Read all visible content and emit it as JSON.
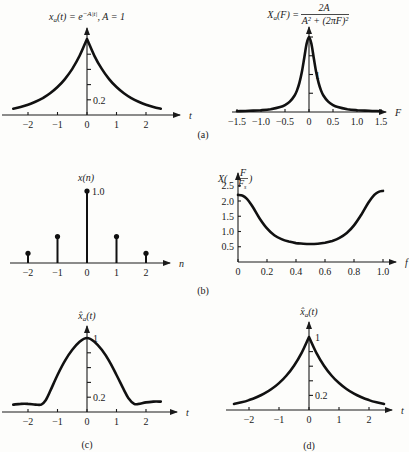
{
  "captions": {
    "a": "(a)",
    "b": "(b)",
    "c": "(c)",
    "d": "(d)"
  },
  "chart_data": [
    {
      "id": "a-left",
      "type": "line",
      "title": "x_a(t) = e^{-A|t|}, A = 1",
      "title_parts": {
        "lhs": "x",
        "sub": "a",
        "mid": "(t) = e",
        "sup": "−A|t|",
        "rhs": ", A = 1"
      },
      "xlabel": "t",
      "ylabel": "",
      "xlim": [
        -2.6,
        2.8
      ],
      "ylim": [
        0,
        1.1
      ],
      "xticks": [
        -2,
        -1,
        0,
        1,
        2
      ],
      "xtick_labels": [
        "−2",
        "−1",
        "0",
        "1",
        "2"
      ],
      "yticks": [
        0.2,
        0.4,
        0.6,
        0.8
      ],
      "ytick_labels_shown": {
        "0.2": "0.2"
      },
      "x": [
        -2.5,
        -2.25,
        -2,
        -1.75,
        -1.5,
        -1.25,
        -1,
        -0.75,
        -0.5,
        -0.25,
        0,
        0.25,
        0.5,
        0.75,
        1,
        1.25,
        1.5,
        1.75,
        2,
        2.25,
        2.5
      ],
      "y": [
        0.082,
        0.105,
        0.135,
        0.174,
        0.223,
        0.287,
        0.368,
        0.472,
        0.607,
        0.779,
        1.0,
        0.779,
        0.607,
        0.472,
        0.368,
        0.287,
        0.223,
        0.174,
        0.135,
        0.105,
        0.082
      ]
    },
    {
      "id": "a-right",
      "type": "line",
      "title": "X_a(F) = 2A / (A^2 + (2πF)^2)",
      "title_parts": {
        "lhs": "X",
        "sub": "a",
        "mid": "(F) = ",
        "num": "2A",
        "den": "A² + (2πF)²"
      },
      "xlabel": "F",
      "ylabel": "",
      "xlim": [
        -1.55,
        1.65
      ],
      "ylim": [
        0,
        2.2
      ],
      "xticks": [
        -1.5,
        -1.0,
        -0.5,
        0,
        0.5,
        1.0,
        1.5
      ],
      "xtick_labels": [
        "−1.5",
        "−1.0",
        "−0.5",
        "0",
        "0.5",
        "1.0",
        "1.5"
      ],
      "yticks": [
        0.5,
        1,
        1.5,
        2
      ],
      "ytick_labels_shown": {
        "1": "1"
      },
      "x": [
        -1.5,
        -1.25,
        -1.0,
        -0.8,
        -0.6,
        -0.5,
        -0.4,
        -0.3,
        -0.25,
        -0.2,
        -0.15,
        -0.1,
        -0.05,
        0,
        0.05,
        0.1,
        0.15,
        0.2,
        0.25,
        0.3,
        0.4,
        0.5,
        0.6,
        0.8,
        1.0,
        1.25,
        1.5
      ],
      "y": [
        0.022,
        0.032,
        0.049,
        0.076,
        0.132,
        0.184,
        0.274,
        0.439,
        0.577,
        0.775,
        1.058,
        1.434,
        1.82,
        2.0,
        1.82,
        1.434,
        1.058,
        0.775,
        0.577,
        0.439,
        0.274,
        0.184,
        0.132,
        0.076,
        0.049,
        0.032,
        0.022
      ]
    },
    {
      "id": "b-left",
      "type": "stem",
      "title": "x(n)",
      "xlabel": "n",
      "xlim": [
        -2.6,
        2.8
      ],
      "ylim": [
        0,
        1.1
      ],
      "xticks": [
        -2,
        -1,
        0,
        1,
        2
      ],
      "xtick_labels": [
        "−2",
        "−1",
        "0",
        "1",
        "2"
      ],
      "annotation": "1.0",
      "x": [
        -2,
        -1,
        0,
        1,
        2
      ],
      "y": [
        0.135,
        0.368,
        1.0,
        0.368,
        0.135
      ]
    },
    {
      "id": "b-right",
      "type": "line",
      "title": "X(F/F_s)",
      "title_parts": {
        "lhs": "X(",
        "num": "F",
        "den": "F",
        "densub": "s",
        "rhs": ")"
      },
      "xlabel": "f",
      "xlim": [
        0,
        1.1
      ],
      "ylim": [
        0,
        2.7
      ],
      "xticks": [
        0,
        0.2,
        0.4,
        0.6,
        0.8,
        1.0
      ],
      "xtick_labels": [
        "0",
        "0.2",
        "0.4",
        "0.6",
        "0.8",
        "1.0"
      ],
      "yticks": [
        0.5,
        1.0,
        1.5,
        2.0,
        2.5
      ],
      "ytick_labels": [
        "0.5",
        "1.0",
        "1.5",
        "2.0",
        "2.5"
      ],
      "x": [
        0,
        0.03,
        0.06,
        0.1,
        0.15,
        0.2,
        0.25,
        0.3,
        0.35,
        0.4,
        0.45,
        0.5,
        0.55,
        0.6,
        0.65,
        0.7,
        0.75,
        0.8,
        0.85,
        0.9,
        0.94,
        0.97,
        1.0
      ],
      "y": [
        2.2,
        2.18,
        2.08,
        1.82,
        1.42,
        1.1,
        0.88,
        0.75,
        0.67,
        0.62,
        0.6,
        0.59,
        0.6,
        0.63,
        0.69,
        0.79,
        0.95,
        1.2,
        1.55,
        1.95,
        2.2,
        2.3,
        2.33
      ]
    },
    {
      "id": "c",
      "type": "line",
      "title": "x̂_a(t)",
      "title_parts": {
        "lhs": "x̂",
        "sub": "a",
        "rhs": "(t)"
      },
      "xlabel": "t",
      "xlim": [
        -2.6,
        2.8
      ],
      "ylim": [
        0,
        1.1
      ],
      "xticks": [
        -2,
        -1,
        0,
        1,
        2
      ],
      "xtick_labels": [
        "−2",
        "−1",
        "0",
        "1",
        "2"
      ],
      "yticks": [
        0.2,
        0.4,
        0.6,
        0.8
      ],
      "ytick_labels_shown": {
        "0.2": "0.2",
        "1": "1"
      },
      "x": [
        -2.5,
        -2.25,
        -2,
        -1.75,
        -1.55,
        -1.4,
        -1.25,
        -1,
        -0.75,
        -0.5,
        -0.25,
        0,
        0.25,
        0.5,
        0.75,
        1,
        1.25,
        1.4,
        1.6,
        1.75,
        2,
        2.25,
        2.5
      ],
      "y": [
        0.1,
        0.11,
        0.11,
        0.1,
        0.1,
        0.16,
        0.28,
        0.5,
        0.69,
        0.84,
        0.95,
        1.0,
        0.95,
        0.84,
        0.69,
        0.5,
        0.3,
        0.19,
        0.11,
        0.11,
        0.13,
        0.14,
        0.14
      ]
    },
    {
      "id": "d",
      "type": "line",
      "title": "x̂_a(t)",
      "title_parts": {
        "lhs": "x̂",
        "sub": "a",
        "rhs": "(t)"
      },
      "xlabel": "t",
      "xlim": [
        -2.6,
        2.8
      ],
      "ylim": [
        0,
        1.1
      ],
      "xticks": [
        -2,
        -1,
        0,
        1,
        2
      ],
      "xtick_labels": [
        "−2",
        "−1",
        "0",
        "1",
        "2"
      ],
      "yticks": [
        0.2,
        0.4,
        0.6,
        0.8
      ],
      "ytick_labels_shown": {
        "0.2": "0.2",
        "1": "1"
      },
      "x": [
        -2.5,
        -2.25,
        -2,
        -1.75,
        -1.5,
        -1.25,
        -1,
        -0.75,
        -0.5,
        -0.25,
        0,
        0.25,
        0.5,
        0.75,
        1,
        1.25,
        1.5,
        1.75,
        2,
        2.25,
        2.5
      ],
      "y": [
        0.082,
        0.105,
        0.135,
        0.174,
        0.223,
        0.287,
        0.368,
        0.472,
        0.607,
        0.779,
        1.0,
        0.779,
        0.607,
        0.472,
        0.368,
        0.287,
        0.223,
        0.174,
        0.135,
        0.105,
        0.082
      ]
    }
  ]
}
